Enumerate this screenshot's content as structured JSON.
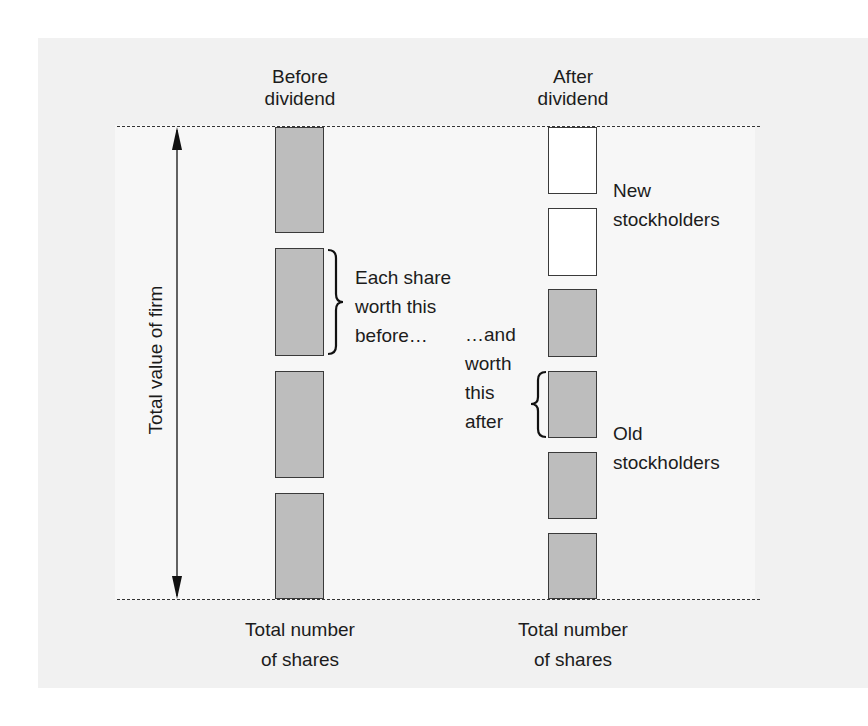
{
  "diagram": {
    "columns": [
      {
        "id": "before",
        "heading": "Before\ndividend",
        "footer": "Total number\nof shares",
        "blocks": [
          {
            "type": "old",
            "fill": "#bdbdbd",
            "top": 127,
            "height": 106
          },
          {
            "type": "old",
            "fill": "#bdbdbd",
            "top": 248,
            "height": 108
          },
          {
            "type": "old",
            "fill": "#bdbdbd",
            "top": 371,
            "height": 107
          },
          {
            "type": "old",
            "fill": "#bdbdbd",
            "top": 493,
            "height": 106
          }
        ]
      },
      {
        "id": "after",
        "heading": "After\ndividend",
        "footer": "Total number\nof shares",
        "blocks": [
          {
            "type": "new",
            "fill": "#ffffff",
            "top": 127,
            "height": 67
          },
          {
            "type": "new",
            "fill": "#ffffff",
            "top": 208,
            "height": 68
          },
          {
            "type": "old",
            "fill": "#bdbdbd",
            "top": 289,
            "height": 68
          },
          {
            "type": "old",
            "fill": "#bdbdbd",
            "top": 371,
            "height": 67
          },
          {
            "type": "old",
            "fill": "#bdbdbd",
            "top": 452,
            "height": 67
          },
          {
            "type": "old",
            "fill": "#bdbdbd",
            "top": 533,
            "height": 66
          }
        ]
      }
    ],
    "axis_label": "Total value of firm",
    "annotations": {
      "each_share_before": "Each share\nworth this\nbefore…",
      "and_after": "…and\nworth\nthis\nafter",
      "new_stockholders": "New\nstockholders",
      "old_stockholders": "Old\nstockholders"
    },
    "colors": {
      "old_share_fill": "#bdbdbd",
      "new_share_fill": "#ffffff",
      "outline": "#3a3a3a",
      "text": "#1c1c1c"
    }
  }
}
